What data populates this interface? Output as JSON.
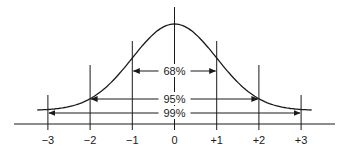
{
  "diagram": {
    "tick_labels": [
      "−3",
      "−2",
      "−1",
      "0",
      "+1",
      "+2",
      "+3"
    ],
    "tick_values": [
      -3,
      -2,
      -1,
      0,
      1,
      2,
      3
    ],
    "intervals": [
      {
        "label": "68%",
        "from": -1,
        "to": 1
      },
      {
        "label": "95%",
        "from": -2,
        "to": 2
      },
      {
        "label": "99%",
        "from": -3,
        "to": 3
      }
    ],
    "line_color": "#1a1a1a"
  }
}
